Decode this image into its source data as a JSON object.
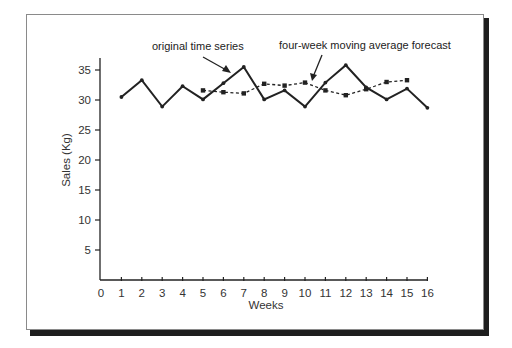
{
  "chart_data": {
    "type": "line",
    "title": "",
    "xlabel": "Weeks",
    "ylabel": "Sales (Kg)",
    "xlim": [
      0,
      16
    ],
    "ylim": [
      0,
      36
    ],
    "x_ticks": [
      0,
      1,
      2,
      3,
      4,
      5,
      6,
      7,
      8,
      9,
      10,
      11,
      12,
      13,
      14,
      15,
      16
    ],
    "y_ticks": [
      5,
      10,
      15,
      20,
      25,
      30,
      35
    ],
    "grid": false,
    "legend": "none (series identified by arrow annotations)",
    "series": [
      {
        "name": "original time series",
        "style": "solid",
        "marker": "dot",
        "color": "#222222",
        "x": [
          1,
          2,
          3,
          4,
          5,
          6,
          7,
          8,
          9,
          10,
          11,
          12,
          13,
          14,
          15,
          16
        ],
        "values": [
          30.5,
          33.3,
          28.9,
          32.3,
          30.1,
          32.8,
          35.5,
          30.1,
          31.6,
          28.9,
          32.9,
          35.8,
          32.1,
          30.1,
          31.9,
          28.7
        ]
      },
      {
        "name": "four-week moving average forecast",
        "style": "dashed",
        "marker": "square",
        "color": "#222222",
        "x": [
          5,
          6,
          7,
          8,
          9,
          10,
          11,
          12,
          13,
          14,
          15
        ],
        "values": [
          31.6,
          31.3,
          31.1,
          32.7,
          32.4,
          32.9,
          31.6,
          30.8,
          31.8,
          33.0,
          33.3
        ]
      }
    ],
    "annotations": [
      {
        "text": "original time series",
        "points_to_series": "original time series",
        "near_x": 6.5
      },
      {
        "text": "four-week moving average forecast",
        "points_to_series": "four-week moving average forecast",
        "near_x": 10.3
      }
    ]
  }
}
